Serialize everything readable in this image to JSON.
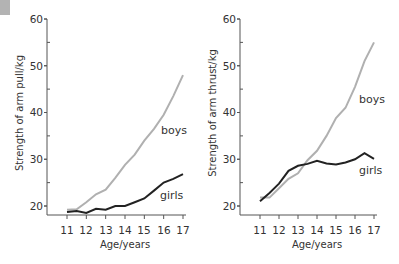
{
  "chart_data": [
    {
      "type": "line",
      "title": "",
      "xlabel": "Age/years",
      "ylabel": "Strength of arm pull/kg",
      "xlim": [
        11,
        17
      ],
      "ylim": [
        18,
        60
      ],
      "x_ticks": [
        "11",
        "12",
        "13",
        "14",
        "15",
        "16",
        "17"
      ],
      "y_ticks": [
        "20",
        "30",
        "40",
        "50",
        "60"
      ],
      "grid": false,
      "legend": "inline labels",
      "x": [
        11,
        11.5,
        12,
        12.5,
        13,
        13.5,
        14,
        14.5,
        15,
        15.5,
        16,
        16.5,
        17
      ],
      "series": [
        {
          "name": "boys",
          "color": "#b0b0b0",
          "values": [
            19.2,
            19.3,
            20.8,
            22.5,
            23.5,
            26,
            28.8,
            31,
            34,
            36.5,
            39.5,
            43.5,
            48
          ]
        },
        {
          "name": "girls",
          "color": "#222222",
          "values": [
            18.7,
            18.9,
            18.5,
            19.4,
            19.2,
            20,
            20,
            20.8,
            21.6,
            23.3,
            25,
            25.8,
            26.8
          ]
        }
      ]
    },
    {
      "type": "line",
      "title": "",
      "xlabel": "Age/years",
      "ylabel": "Strength of arm thrust/kg",
      "xlim": [
        11,
        17
      ],
      "ylim": [
        18,
        60
      ],
      "x_ticks": [
        "11",
        "12",
        "13",
        "14",
        "15",
        "16",
        "17"
      ],
      "y_ticks": [
        "20",
        "30",
        "40",
        "50",
        "60"
      ],
      "grid": false,
      "legend": "inline labels",
      "x": [
        11,
        11.5,
        12,
        12.5,
        13,
        13.5,
        14,
        14.5,
        15,
        15.5,
        16,
        16.5,
        17
      ],
      "series": [
        {
          "name": "boys",
          "color": "#b0b0b0",
          "values": [
            21.8,
            21.8,
            23.8,
            25.8,
            27,
            29.8,
            31.8,
            35,
            38.8,
            41,
            45.5,
            51,
            55
          ]
        },
        {
          "name": "girls",
          "color": "#222222",
          "values": [
            21,
            22.8,
            24.8,
            27.5,
            28.6,
            29,
            29.7,
            29.1,
            28.9,
            29.3,
            30,
            31.3,
            30.1
          ]
        }
      ]
    }
  ],
  "charts": [
    {
      "ylabel": "Strength of arm pull/kg",
      "xlabel": "Age/years",
      "boys_label": "boys",
      "girls_label": "girls",
      "y_ticks": [
        "60",
        "50",
        "40",
        "30",
        "20"
      ],
      "x_ticks": [
        "11",
        "12",
        "13",
        "14",
        "15",
        "16",
        "17"
      ]
    },
    {
      "ylabel": "Strength of arm thrust/kg",
      "xlabel": "Age/years",
      "boys_label": "boys",
      "girls_label": "girls",
      "y_ticks": [
        "60",
        "50",
        "40",
        "30",
        "20"
      ],
      "x_ticks": [
        "11",
        "12",
        "13",
        "14",
        "15",
        "16",
        "17"
      ]
    }
  ]
}
